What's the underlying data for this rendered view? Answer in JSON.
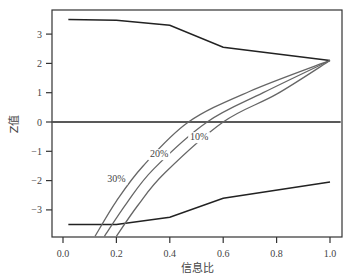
{
  "chart_data": {
    "type": "line",
    "title": "",
    "xlabel": "信息比",
    "ylabel": "Z值",
    "xlim": [
      -0.04,
      1.04
    ],
    "ylim": [
      -3.9,
      3.75
    ],
    "xticks": [
      "0.0",
      "0.2",
      "0.4",
      "0.6",
      "0.8",
      "1.0"
    ],
    "yticks": [
      "-3",
      "-2",
      "-1",
      "0",
      "1",
      "2",
      "3"
    ],
    "grid": false,
    "legend": "inline labels on curves",
    "series": [
      {
        "name": "upper bound",
        "color": "#222222",
        "x": [
          0.02,
          0.2,
          0.4,
          0.6,
          1.0
        ],
        "y": [
          3.5,
          3.47,
          3.3,
          2.55,
          2.1
        ]
      },
      {
        "name": "lower bound",
        "color": "#222222",
        "x": [
          0.02,
          0.2,
          0.4,
          0.6,
          1.0
        ],
        "y": [
          -3.5,
          -3.5,
          -3.25,
          -2.6,
          -2.05
        ]
      },
      {
        "name": "zero line",
        "color": "#222222",
        "x": [
          -0.04,
          1.04
        ],
        "y": [
          0,
          0
        ]
      },
      {
        "name": "30%",
        "color": "#666666",
        "x": [
          0.12,
          0.2,
          0.3,
          0.47,
          0.7,
          1.0
        ],
        "y": [
          -3.9,
          -2.7,
          -1.5,
          0.0,
          1.05,
          2.1
        ]
      },
      {
        "name": "20%",
        "color": "#666666",
        "x": [
          0.155,
          0.24,
          0.34,
          0.54,
          0.75,
          1.0
        ],
        "y": [
          -3.9,
          -2.75,
          -1.6,
          0.0,
          1.0,
          2.1
        ]
      },
      {
        "name": "10%",
        "color": "#666666",
        "x": [
          0.2,
          0.28,
          0.38,
          0.6,
          0.8,
          1.0
        ],
        "y": [
          -3.9,
          -2.85,
          -1.75,
          0.0,
          0.95,
          2.1
        ]
      }
    ],
    "annotations": [
      {
        "text": "30%",
        "x": 0.2,
        "y": -2.05
      },
      {
        "text": "20%",
        "x": 0.36,
        "y": -1.2
      },
      {
        "text": "10%",
        "x": 0.51,
        "y": -0.62
      }
    ]
  }
}
